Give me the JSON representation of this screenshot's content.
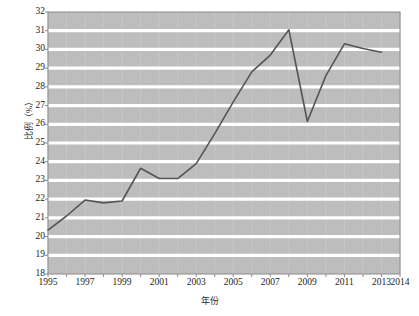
{
  "chart_data": {
    "type": "line",
    "title": "",
    "xlabel": "年份",
    "ylabel": "比例（%）",
    "x": [
      1995,
      1996,
      1997,
      1998,
      1999,
      2000,
      2001,
      2002,
      2003,
      2004,
      2005,
      2006,
      2007,
      2008,
      2009,
      2010,
      2011,
      2012,
      2013
    ],
    "values": [
      20.35,
      21.1,
      21.95,
      21.8,
      21.9,
      23.65,
      23.1,
      23.1,
      23.9,
      25.5,
      27.2,
      28.8,
      29.7,
      31.05,
      26.15,
      28.6,
      30.3,
      30.05,
      29.85
    ],
    "series": [
      {
        "name": "比例（%）",
        "values": [
          20.35,
          21.1,
          21.95,
          21.8,
          21.9,
          23.65,
          23.1,
          23.1,
          23.9,
          25.5,
          27.2,
          28.8,
          29.7,
          31.05,
          26.15,
          28.6,
          30.3,
          30.05,
          29.85
        ]
      }
    ],
    "xlim": [
      1995,
      2014
    ],
    "ylim": [
      18,
      32
    ],
    "y_ticks": [
      18,
      19,
      20,
      21,
      22,
      23,
      24,
      25,
      26,
      27,
      28,
      29,
      30,
      31,
      32
    ],
    "x_ticks": [
      1995,
      1996,
      1997,
      1998,
      1999,
      2000,
      2001,
      2002,
      2003,
      2004,
      2005,
      2006,
      2007,
      2008,
      2009,
      2010,
      2011,
      2012,
      2013,
      2014
    ],
    "x_tick_labels": [
      "1995",
      "",
      "1997",
      "",
      "1999",
      "",
      "2001",
      "",
      "2003",
      "",
      "2005",
      "",
      "2007",
      "",
      "2009",
      "",
      "2011",
      "",
      "2013",
      "2014"
    ],
    "y_tick_labels": [
      "18",
      "19",
      "20",
      "21",
      "22",
      "23",
      "24",
      "25",
      "26",
      "27",
      "28",
      "29",
      "30",
      "31",
      "32"
    ],
    "grid": {
      "horizontal": true,
      "vertical": true,
      "horizontal_color": "#ffffff",
      "vertical_color": "#c9c9c9"
    },
    "legend": null,
    "legend_position": "none",
    "colors": {
      "plot_background": "#bdbdbd",
      "line": "#555555",
      "frame": "#8a8a8a",
      "text": "#1c1c1c"
    },
    "line_width": 1.6
  }
}
